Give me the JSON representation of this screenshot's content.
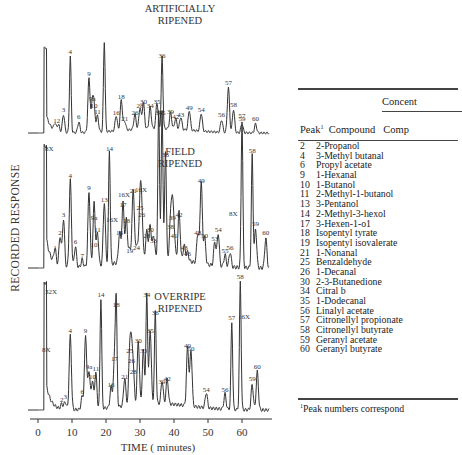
{
  "chart_data": {
    "type": "line",
    "xlabel": "TIME ( minutes)",
    "ylabel": "RECORDED RESPONSE",
    "xlim": [
      0,
      68
    ],
    "xticks": [
      0,
      10,
      20,
      30,
      40,
      50,
      60
    ],
    "grid": false,
    "series": [
      {
        "name": "ARTIFICIALLY RIPENED",
        "title_lines": [
          "ARTIFICIALLY",
          "RIPENED"
        ],
        "peaks": [
          {
            "label": "1",
            "t": 5,
            "h": 0.08
          },
          {
            "label": "2",
            "t": 6,
            "h": 0.08
          },
          {
            "label": "3",
            "t": 7.5,
            "h": 0.2
          },
          {
            "label": "4",
            "t": 9.5,
            "h": 0.85
          },
          {
            "label": "6",
            "t": 12,
            "h": 0.12
          },
          {
            "label": "9",
            "t": 15,
            "h": 0.6
          },
          {
            "label": "9a",
            "t": 16,
            "h": 0.32
          },
          {
            "label": "10",
            "t": 16.5,
            "h": 0.25
          },
          {
            "label": "11",
            "t": 17.5,
            "h": 0.18
          },
          {
            "label": "",
            "t": 19.5,
            "h": 1.0
          },
          {
            "label": "16",
            "t": 23,
            "h": 0.17
          },
          {
            "label": "18",
            "t": 24.5,
            "h": 0.34
          },
          {
            "label": "21",
            "t": 25.5,
            "h": 0.1
          },
          {
            "label": "26",
            "t": 28.5,
            "h": 0.17
          },
          {
            "label": "28",
            "t": 30,
            "h": 0.24
          },
          {
            "label": "30",
            "t": 31,
            "h": 0.29
          },
          {
            "label": "34",
            "t": 33,
            "h": 0.24
          },
          {
            "label": "35",
            "t": 35,
            "h": 0.29
          },
          {
            "label": "36",
            "t": 36.5,
            "h": 0.8
          },
          {
            "label": "39",
            "t": 39,
            "h": 0.18
          },
          {
            "label": "42",
            "t": 40.5,
            "h": 0.12
          },
          {
            "label": "43",
            "t": 42,
            "h": 0.14
          },
          {
            "label": "49",
            "t": 44.5,
            "h": 0.22
          },
          {
            "label": "54",
            "t": 48,
            "h": 0.2
          },
          {
            "label": "56",
            "t": 54,
            "h": 0.14
          },
          {
            "label": "57",
            "t": 56,
            "h": 0.5
          },
          {
            "label": "58",
            "t": 57.5,
            "h": 0.26
          },
          {
            "label": "59",
            "t": 60,
            "h": 0.1
          },
          {
            "label": "60",
            "t": 64,
            "h": 0.1
          }
        ],
        "annotations": []
      },
      {
        "name": "FIELD RIPENED",
        "title_lines": [
          "FIELD",
          "RIPENED"
        ],
        "peaks": [
          {
            "label": "1",
            "t": 5,
            "h": 0.1
          },
          {
            "label": "2",
            "t": 6.5,
            "h": 0.2
          },
          {
            "label": "3",
            "t": 7.5,
            "h": 0.32
          },
          {
            "label": "4",
            "t": 9.5,
            "h": 0.58
          },
          {
            "label": "6",
            "t": 11,
            "h": 0.14
          },
          {
            "label": "7",
            "t": 13,
            "h": 0.05
          },
          {
            "label": "9",
            "t": 15,
            "h": 0.5
          },
          {
            "label": "9a",
            "t": 16.5,
            "h": 0.3
          },
          {
            "label": "10",
            "t": 16.5,
            "h": 0.12
          },
          {
            "label": "11",
            "t": 17.5,
            "h": 0.22
          },
          {
            "label": "13",
            "t": 19.5,
            "h": 0.42
          },
          {
            "label": "14",
            "t": 21,
            "h": 0.76
          },
          {
            "label": "16",
            "t": 24,
            "h": 0.2
          },
          {
            "label": "17",
            "t": 25,
            "h": 0.39
          },
          {
            "label": "18",
            "t": 26,
            "h": 0.28
          },
          {
            "label": "19",
            "t": 27,
            "h": 0.08
          },
          {
            "label": "21",
            "t": 28,
            "h": 0.48
          },
          {
            "label": "24",
            "t": 29,
            "h": 0.1
          },
          {
            "label": "25",
            "t": 30,
            "h": 0.37
          },
          {
            "label": "26",
            "t": 30.5,
            "h": 0.32
          },
          {
            "label": "28",
            "t": 32,
            "h": 0.18
          },
          {
            "label": "30",
            "t": 33,
            "h": 0.22
          },
          {
            "label": "33",
            "t": 34,
            "h": 0.15
          },
          {
            "label": "34",
            "t": 35.5,
            "h": 1.0
          },
          {
            "label": "35",
            "t": 36.5,
            "h": 1.0
          },
          {
            "label": "36",
            "t": 37.5,
            "h": 0.72
          },
          {
            "label": "38",
            "t": 39,
            "h": 0.24
          },
          {
            "label": "39",
            "t": 39.5,
            "h": 0.3
          },
          {
            "label": "41",
            "t": 40,
            "h": 0.18
          },
          {
            "label": "42",
            "t": 41.5,
            "h": 0.32
          },
          {
            "label": "43",
            "t": 43,
            "h": 0.1
          },
          {
            "label": "46",
            "t": 44,
            "h": 0.06
          },
          {
            "label": "48",
            "t": 47,
            "h": 0.2
          },
          {
            "label": "49",
            "t": 48,
            "h": 0.55
          },
          {
            "label": "50",
            "t": 49,
            "h": 0.18
          },
          {
            "label": "53",
            "t": 52,
            "h": 0.16
          },
          {
            "label": "54",
            "t": 53,
            "h": 0.22
          },
          {
            "label": "55",
            "t": 55,
            "h": 0.08
          },
          {
            "label": "56",
            "t": 56.5,
            "h": 0.1
          },
          {
            "label": "57",
            "t": 60,
            "h": 0.98
          },
          {
            "label": "58",
            "t": 63,
            "h": 0.75
          },
          {
            "label": "59",
            "t": 64,
            "h": 0.26
          },
          {
            "label": "60",
            "t": 67,
            "h": 0.2
          }
        ],
        "annotations": [
          "8X",
          "16X",
          "16X",
          "16X",
          "8X"
        ]
      },
      {
        "name": "OVERRIPE RIPENED",
        "title_lines": [
          "OVERRIPE",
          "RIPENED"
        ],
        "peaks": [
          {
            "label": "2",
            "t": 7,
            "h": 0.04
          },
          {
            "label": "3",
            "t": 8,
            "h": 0.06
          },
          {
            "label": "4",
            "t": 9.5,
            "h": 0.58
          },
          {
            "label": "6",
            "t": 13,
            "h": 0.1
          },
          {
            "label": "9",
            "t": 14,
            "h": 0.58
          },
          {
            "label": "9a",
            "t": 15,
            "h": 0.3
          },
          {
            "label": "10",
            "t": 16,
            "h": 0.22
          },
          {
            "label": "11",
            "t": 17,
            "h": 0.28
          },
          {
            "label": "14",
            "t": 18.5,
            "h": 0.86
          },
          {
            "label": "16",
            "t": 21.5,
            "h": 0.16
          },
          {
            "label": "17",
            "t": 22.5,
            "h": 0.36
          },
          {
            "label": "18",
            "t": 23,
            "h": 0.78
          },
          {
            "label": "21",
            "t": 25.5,
            "h": 0.22
          },
          {
            "label": "25",
            "t": 27,
            "h": 0.42
          },
          {
            "label": "26",
            "t": 27.5,
            "h": 0.34
          },
          {
            "label": "28",
            "t": 28,
            "h": 0.26
          },
          {
            "label": "30",
            "t": 29.5,
            "h": 0.5
          },
          {
            "label": "33",
            "t": 31,
            "h": 0.42
          },
          {
            "label": "34",
            "t": 32,
            "h": 0.86
          },
          {
            "label": "35",
            "t": 33,
            "h": 0.58
          },
          {
            "label": "36",
            "t": 34.5,
            "h": 0.72
          },
          {
            "label": "39",
            "t": 36.5,
            "h": 0.18
          },
          {
            "label": "42",
            "t": 38,
            "h": 0.2
          },
          {
            "label": "49",
            "t": 44,
            "h": 0.46
          },
          {
            "label": "50",
            "t": 45,
            "h": 0.44
          },
          {
            "label": "54",
            "t": 49.5,
            "h": 0.12
          },
          {
            "label": "56",
            "t": 55,
            "h": 0.12
          },
          {
            "label": "57",
            "t": 57,
            "h": 0.68
          },
          {
            "label": "58",
            "t": 59.5,
            "h": 1.0
          },
          {
            "label": "59",
            "t": 63,
            "h": 0.2
          },
          {
            "label": "60",
            "t": 64.5,
            "h": 0.3
          }
        ],
        "annotations": [
          "32X",
          "8X",
          "16X"
        ]
      }
    ]
  },
  "figure": {
    "panel_titles": [
      [
        "ARTIFICIALLY",
        "RIPENED"
      ],
      [
        "FIELD",
        "RIPENED"
      ],
      [
        "OVERRIPE",
        "RIPENED"
      ]
    ],
    "ylabel": "RECORDED RESPONSE",
    "xlabel": "TIME ( minutes)",
    "xticks": [
      "0",
      "10",
      "20",
      "30",
      "40",
      "50",
      "60"
    ]
  },
  "table": {
    "group_header": "Concent",
    "columns": {
      "peak": "Peak",
      "peak_sup": "1",
      "compound": "Compound",
      "comp": "Comp"
    },
    "rows": [
      {
        "peak": "2",
        "compound": "2-Propanol"
      },
      {
        "peak": "4",
        "compound": "3-Methyl butanal"
      },
      {
        "peak": "6",
        "compound": "Propyl acetate"
      },
      {
        "peak": "9",
        "compound": "1-Hexanal"
      },
      {
        "peak": "10",
        "compound": "1-Butanol"
      },
      {
        "peak": "11",
        "compound": "2-Methyl-1-butanol"
      },
      {
        "peak": "13",
        "compound": "3-Pentanol"
      },
      {
        "peak": "14",
        "compound": "2-Methyl-3-hexol"
      },
      {
        "peak": "17",
        "compound": "3-Hexen-1-o1"
      },
      {
        "peak": "18",
        "compound": "Isopentyl tyrate"
      },
      {
        "peak": "19",
        "compound": "Isopentyl isovalerate"
      },
      {
        "peak": "21",
        "compound": "1-Nonanal"
      },
      {
        "peak": "25",
        "compound": "Benzaldehyde"
      },
      {
        "peak": "26",
        "compound": "1-Decanal"
      },
      {
        "peak": "30",
        "compound": "2-3-Butanedione"
      },
      {
        "peak": "34",
        "compound": "Citral b"
      },
      {
        "peak": "35",
        "compound": "1-Dodecanal"
      },
      {
        "peak": "56",
        "compound": "Linalyl acetate"
      },
      {
        "peak": "57",
        "compound": "Citronellyl propionate"
      },
      {
        "peak": "58",
        "compound": "Citronellyl butyrate"
      },
      {
        "peak": "59",
        "compound": "Geranyl acetate"
      },
      {
        "peak": "60",
        "compound": "Geranyl butyrate"
      }
    ],
    "footnote_sup": "1",
    "footnote": "Peak numbers correspond"
  }
}
